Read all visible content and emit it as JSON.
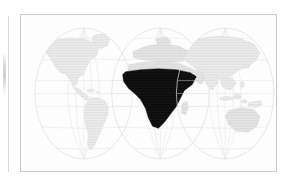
{
  "figure": {
    "kind": "world-map",
    "title": "",
    "projection_name": "interrupted-goode-homolosine",
    "frame_border_color": "#c9c9c9",
    "background_color": "#fdfdfd",
    "alt_text": "Interrupted world map with Africa highlighted"
  },
  "map_data": {
    "type": "choropleth-highlight",
    "projection": "interrupted three-lobe (Goode homolosine style)",
    "lobes": [
      {
        "id": "lobe-americas",
        "label": "Americas",
        "center_x": 63,
        "center_y": 79,
        "rx": 49,
        "ry": 66
      },
      {
        "id": "lobe-africa-europe",
        "label": "Africa and Europe",
        "center_x": 140,
        "center_y": 79,
        "rx": 49,
        "ry": 66
      },
      {
        "id": "lobe-asia-oceania",
        "label": "Asia and Oceania",
        "center_x": 205,
        "center_y": 79,
        "rx": 49,
        "ry": 66
      }
    ],
    "graticule": {
      "visible": true,
      "color": "#e2e2e2",
      "meridian_interval_deg": 30,
      "parallel_interval_deg": 20
    },
    "regions": [
      {
        "name": "North America",
        "highlighted": false,
        "fill": "#e9e9e9"
      },
      {
        "name": "South America",
        "highlighted": false,
        "fill": "#e9e9e9"
      },
      {
        "name": "Greenland",
        "highlighted": false,
        "fill": "#ececec"
      },
      {
        "name": "Europe",
        "highlighted": false,
        "fill": "#e4e4e4"
      },
      {
        "name": "North Africa",
        "highlighted": false,
        "fill": "#e4e4e4"
      },
      {
        "name": "Sub-Saharan Africa",
        "highlighted": true,
        "fill": "#121212"
      },
      {
        "name": "Madagascar",
        "highlighted": false,
        "fill": "#e0e0e0"
      },
      {
        "name": "Asia",
        "highlighted": false,
        "fill": "#e6e6e6"
      },
      {
        "name": "Southeast Asia",
        "highlighted": false,
        "fill": "#e6e6e6"
      },
      {
        "name": "Australia",
        "highlighted": false,
        "fill": "#e4e4e4"
      },
      {
        "name": "New Zealand",
        "highlighted": false,
        "fill": "#e6e6e6"
      }
    ],
    "legend": {
      "visible": false,
      "entries": []
    },
    "colors": {
      "highlight": "#121212",
      "land": "#e7e7e7",
      "land_stroke": "#d8d8d8",
      "ocean": "#fdfdfd",
      "graticule": "#e2e2e2",
      "lobe_outline": "#e0e0e0"
    }
  }
}
